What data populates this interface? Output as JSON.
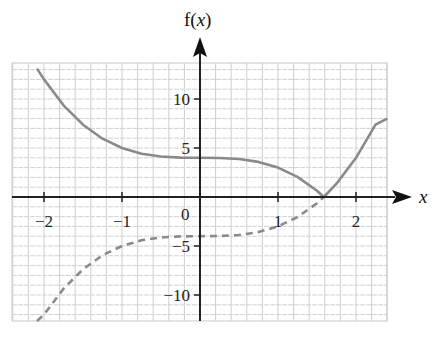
{
  "chart_data": {
    "type": "line",
    "title": "",
    "xlabel": "x",
    "ylabel": "f(x)",
    "xlim": [
      -2.4,
      2.4
    ],
    "ylim": [
      -13,
      14
    ],
    "grid": true,
    "x_ticks": [
      -2,
      -1,
      1,
      2
    ],
    "x_tick_labels": [
      "−2",
      "−1",
      "1",
      "2"
    ],
    "y_ticks": [
      10,
      5,
      -5,
      -10
    ],
    "y_tick_labels": [
      "10",
      "5",
      "−5",
      "−10"
    ],
    "origin_label": "0",
    "series": [
      {
        "name": "solid curve |x^3 - 4|",
        "style": "solid",
        "color": "#8a8a8a",
        "x": [
          -2.09,
          -2.0,
          -1.75,
          -1.5,
          -1.25,
          -1.0,
          -0.75,
          -0.5,
          -0.25,
          0.0,
          0.25,
          0.5,
          0.75,
          1.0,
          1.25,
          1.5,
          1.587,
          1.75,
          2.0,
          2.25,
          2.4
        ],
        "y": [
          13.1,
          12.0,
          9.36,
          7.38,
          5.95,
          5.0,
          4.42,
          4.13,
          4.02,
          4.0,
          3.98,
          3.88,
          3.58,
          3.0,
          2.05,
          0.63,
          0.0,
          1.36,
          4.0,
          7.39,
          8.0
        ]
      },
      {
        "name": "dashed curve x^3 - 4",
        "style": "dashed",
        "color": "#8a8a8a",
        "x": [
          -2.09,
          -2.0,
          -1.75,
          -1.5,
          -1.25,
          -1.0,
          -0.75,
          -0.5,
          -0.25,
          0.0,
          0.25,
          0.5,
          0.75,
          1.0,
          1.25,
          1.5,
          1.587
        ],
        "y": [
          -13.1,
          -12.0,
          -9.36,
          -7.38,
          -5.95,
          -5.0,
          -4.42,
          -4.13,
          -4.02,
          -4.0,
          -3.98,
          -3.88,
          -3.58,
          -3.0,
          -2.05,
          -0.63,
          0.0
        ]
      }
    ]
  },
  "labels": {
    "y_axis_title_f": "f(",
    "y_axis_title_x": "x",
    "y_axis_title_close": ")",
    "x_axis_title": "x"
  }
}
